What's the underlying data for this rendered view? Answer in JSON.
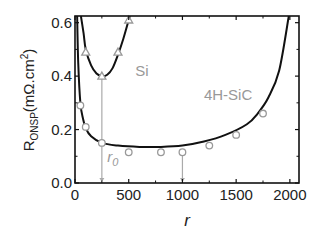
{
  "chart_data": {
    "type": "line",
    "title": "",
    "xlabel": "r",
    "ylabel": "R_ONSP (mΩ.cm²)",
    "ylabel_main": "R",
    "ylabel_sub": "ONSP",
    "ylabel_unit": "(mΩ.cm",
    "ylabel_sup": "2",
    "ylabel_close": ")",
    "xlim": [
      0,
      2085
    ],
    "ylim": [
      0,
      0.625
    ],
    "xticks": [
      0,
      500,
      1000,
      1500,
      2000
    ],
    "xtick_labels": [
      "0",
      "500",
      "1000",
      "1500",
      "2000"
    ],
    "yticks": [
      0.0,
      0.2,
      0.4,
      0.6
    ],
    "ytick_labels": [
      "0.0",
      "0.2",
      "0.4",
      "0.6"
    ],
    "grid": false,
    "legend": "none",
    "series": [
      {
        "name": "Si (model curve)",
        "kind": "line",
        "color": "#111111",
        "points": [
          [
            55,
            0.625
          ],
          [
            80,
            0.56
          ],
          [
            100,
            0.5
          ],
          [
            150,
            0.44
          ],
          [
            200,
            0.41
          ],
          [
            250,
            0.4
          ],
          [
            300,
            0.405
          ],
          [
            350,
            0.43
          ],
          [
            400,
            0.48
          ],
          [
            450,
            0.54
          ],
          [
            500,
            0.61
          ],
          [
            510,
            0.625
          ]
        ]
      },
      {
        "name": "Si (data)",
        "kind": "markers",
        "marker": "triangle",
        "color": "#999999",
        "points": [
          [
            100,
            0.49
          ],
          [
            250,
            0.4
          ],
          [
            400,
            0.49
          ],
          [
            500,
            0.61
          ]
        ]
      },
      {
        "name": "4H-SiC (model curve)",
        "kind": "line",
        "color": "#111111",
        "points": [
          [
            20,
            0.625
          ],
          [
            30,
            0.45
          ],
          [
            50,
            0.3
          ],
          [
            75,
            0.24
          ],
          [
            100,
            0.205
          ],
          [
            150,
            0.175
          ],
          [
            250,
            0.15
          ],
          [
            400,
            0.14
          ],
          [
            600,
            0.135
          ],
          [
            800,
            0.135
          ],
          [
            1000,
            0.14
          ],
          [
            1200,
            0.155
          ],
          [
            1400,
            0.18
          ],
          [
            1600,
            0.22
          ],
          [
            1700,
            0.26
          ],
          [
            1800,
            0.32
          ],
          [
            1900,
            0.42
          ],
          [
            1990,
            0.625
          ]
        ]
      },
      {
        "name": "4H-SiC (data)",
        "kind": "markers",
        "marker": "circle",
        "color": "#999999",
        "points": [
          [
            50,
            0.29
          ],
          [
            100,
            0.21
          ],
          [
            250,
            0.15
          ],
          [
            500,
            0.115
          ],
          [
            800,
            0.115
          ],
          [
            1000,
            0.115
          ],
          [
            1250,
            0.14
          ],
          [
            1500,
            0.18
          ],
          [
            1750,
            0.26
          ]
        ]
      }
    ],
    "annotations": [
      {
        "text": "Si",
        "x": 560,
        "y": 0.4,
        "color": "#999999"
      },
      {
        "text": "4H-SiC",
        "x": 1200,
        "y": 0.31,
        "color": "#999999"
      },
      {
        "text": "r",
        "sub": "0",
        "x": 300,
        "y": 0.08,
        "color": "#999999",
        "italic": true
      }
    ],
    "vertical_markers": [
      {
        "x": 250,
        "from": 0.4,
        "to": 0.0,
        "color": "#aaaaaa",
        "label": "r0 for Si"
      },
      {
        "x": 1000,
        "from": 0.115,
        "to": 0.0,
        "color": "#aaaaaa",
        "label": "r0 for 4H-SiC"
      }
    ]
  }
}
